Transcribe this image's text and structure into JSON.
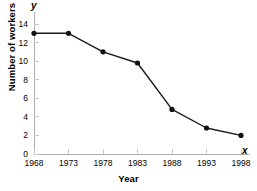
{
  "chart_data": {
    "type": "line",
    "title": "",
    "xlabel": "Year",
    "ylabel": "Number of workers",
    "x_axis_variable": "x",
    "y_axis_variable": "y",
    "categories": [
      "1968",
      "1973",
      "1978",
      "1983",
      "1988",
      "1993",
      "1998"
    ],
    "x": [
      1968,
      1973,
      1978,
      1983,
      1988,
      1993,
      1998
    ],
    "values": [
      13,
      13,
      11,
      9.8,
      4.8,
      2.8,
      2
    ],
    "series": [
      {
        "name": "Number of workers",
        "values": [
          13,
          13,
          11,
          9.8,
          4.8,
          2.8,
          2
        ]
      }
    ],
    "xlim": [
      1968,
      1998
    ],
    "ylim": [
      0,
      14
    ],
    "xticks": [
      "1968",
      "1973",
      "1978",
      "1983",
      "1988",
      "1993",
      "1998"
    ],
    "yticks": [
      "0",
      "2",
      "4",
      "6",
      "8",
      "10",
      "12",
      "14"
    ],
    "ytick_values": [
      0,
      2,
      4,
      6,
      8,
      10,
      12,
      14
    ],
    "grid": false,
    "legend": null,
    "legend_position": "none",
    "marker": "filled-circle",
    "line_color": "#1a1a1a",
    "marker_color": "#111111",
    "axis_color": "#b4b4b4",
    "text_color": "#000000",
    "background_color": "#ffffff"
  }
}
